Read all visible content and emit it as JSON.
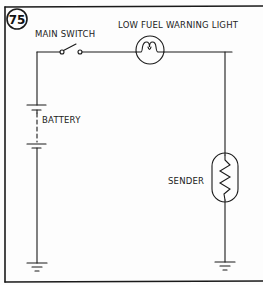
{
  "figure": {
    "number": "75",
    "colors": {
      "ink": "#1a1a1a",
      "background": "#fdfdfd"
    }
  },
  "labels": {
    "main_switch": "MAIN SWITCH",
    "warning_light": "LOW FUEL WARNING LIGHT",
    "battery": "BATTERY",
    "sender": "SENDER"
  },
  "components": [
    {
      "id": "battery",
      "type": "battery",
      "label": "BATTERY"
    },
    {
      "id": "main-switch",
      "type": "switch",
      "label": "MAIN SWITCH",
      "state": "open"
    },
    {
      "id": "warning-light",
      "type": "lamp",
      "label": "LOW FUEL WARNING LIGHT"
    },
    {
      "id": "sender",
      "type": "variable-resistor",
      "label": "SENDER"
    },
    {
      "id": "ground-left",
      "type": "ground"
    },
    {
      "id": "ground-right",
      "type": "ground"
    }
  ]
}
